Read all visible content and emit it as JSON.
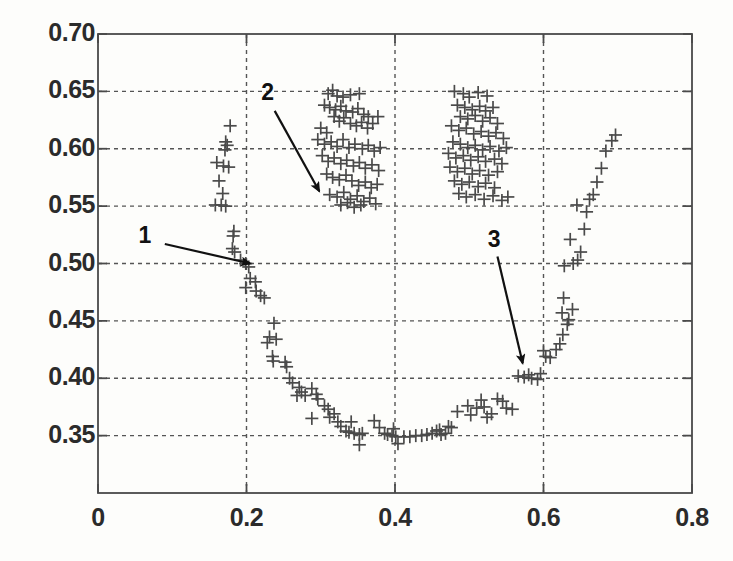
{
  "figure": {
    "type": "scatter-plot",
    "background_color": "#fdfdfb",
    "axis_color": "#4a4a4a",
    "grid_color": "#555555",
    "marker_color": "#4a4a4a",
    "annotation_color": "#111111"
  },
  "chart_data": {
    "type": "scatter",
    "title": "",
    "xlabel": "",
    "ylabel": "",
    "xlim": [
      0,
      0.8
    ],
    "ylim": [
      0.3,
      0.7
    ],
    "xticks": [
      0,
      0.2,
      0.4,
      0.6,
      0.8
    ],
    "xticklabels": [
      "0",
      "0.2",
      "0.4",
      "0.6",
      "0.8"
    ],
    "yticks": [
      0.35,
      0.4,
      0.45,
      0.5,
      0.55,
      0.6,
      0.65,
      0.7
    ],
    "yticklabels": [
      "0.35",
      "0.40",
      "0.45",
      "0.50",
      "0.55",
      "0.60",
      "0.65",
      "0.70"
    ],
    "yticklabels_shown": [
      "0.35",
      "0.40",
      "0.45",
      "0.50",
      "0.55",
      "0.60",
      "0.65",
      "0.70"
    ],
    "grid": true,
    "grid_style": "dashed",
    "legend": null,
    "marker": "+",
    "series": [
      {
        "name": "data",
        "points": [
          [
            0.178,
            0.62
          ],
          [
            0.172,
            0.606
          ],
          [
            0.174,
            0.603
          ],
          [
            0.171,
            0.599
          ],
          [
            0.16,
            0.588
          ],
          [
            0.169,
            0.585
          ],
          [
            0.176,
            0.584
          ],
          [
            0.163,
            0.572
          ],
          [
            0.168,
            0.561
          ],
          [
            0.158,
            0.551
          ],
          [
            0.166,
            0.551
          ],
          [
            0.172,
            0.55
          ],
          [
            0.183,
            0.528
          ],
          [
            0.182,
            0.524
          ],
          [
            0.181,
            0.513
          ],
          [
            0.184,
            0.51
          ],
          [
            0.192,
            0.503
          ],
          [
            0.199,
            0.5
          ],
          [
            0.203,
            0.497
          ],
          [
            0.205,
            0.487
          ],
          [
            0.212,
            0.484
          ],
          [
            0.199,
            0.479
          ],
          [
            0.213,
            0.476
          ],
          [
            0.219,
            0.472
          ],
          [
            0.224,
            0.47
          ],
          [
            0.237,
            0.448
          ],
          [
            0.231,
            0.436
          ],
          [
            0.24,
            0.434
          ],
          [
            0.228,
            0.431
          ],
          [
            0.235,
            0.419
          ],
          [
            0.236,
            0.415
          ],
          [
            0.252,
            0.414
          ],
          [
            0.254,
            0.41
          ],
          [
            0.258,
            0.4
          ],
          [
            0.262,
            0.396
          ],
          [
            0.271,
            0.392
          ],
          [
            0.274,
            0.388
          ],
          [
            0.268,
            0.385
          ],
          [
            0.279,
            0.385
          ],
          [
            0.288,
            0.391
          ],
          [
            0.294,
            0.386
          ],
          [
            0.296,
            0.382
          ],
          [
            0.305,
            0.376
          ],
          [
            0.31,
            0.373
          ],
          [
            0.288,
            0.365
          ],
          [
            0.312,
            0.366
          ],
          [
            0.318,
            0.369
          ],
          [
            0.323,
            0.362
          ],
          [
            0.327,
            0.358
          ],
          [
            0.334,
            0.354
          ],
          [
            0.338,
            0.353
          ],
          [
            0.345,
            0.352
          ],
          [
            0.341,
            0.362
          ],
          [
            0.352,
            0.351
          ],
          [
            0.356,
            0.352
          ],
          [
            0.352,
            0.342
          ],
          [
            0.372,
            0.363
          ],
          [
            0.379,
            0.357
          ],
          [
            0.386,
            0.352
          ],
          [
            0.39,
            0.351
          ],
          [
            0.396,
            0.35
          ],
          [
            0.398,
            0.356
          ],
          [
            0.401,
            0.349
          ],
          [
            0.404,
            0.343
          ],
          [
            0.412,
            0.349
          ],
          [
            0.42,
            0.349
          ],
          [
            0.428,
            0.35
          ],
          [
            0.436,
            0.35
          ],
          [
            0.443,
            0.351
          ],
          [
            0.45,
            0.352
          ],
          [
            0.456,
            0.354
          ],
          [
            0.46,
            0.355
          ],
          [
            0.462,
            0.351
          ],
          [
            0.468,
            0.352
          ],
          [
            0.472,
            0.358
          ],
          [
            0.476,
            0.357
          ],
          [
            0.484,
            0.371
          ],
          [
            0.498,
            0.376
          ],
          [
            0.502,
            0.368
          ],
          [
            0.51,
            0.374
          ],
          [
            0.516,
            0.381
          ],
          [
            0.52,
            0.375
          ],
          [
            0.524,
            0.366
          ],
          [
            0.53,
            0.369
          ],
          [
            0.538,
            0.382
          ],
          [
            0.545,
            0.38
          ],
          [
            0.55,
            0.374
          ],
          [
            0.558,
            0.373
          ],
          [
            0.566,
            0.402
          ],
          [
            0.574,
            0.401
          ],
          [
            0.58,
            0.403
          ],
          [
            0.584,
            0.4
          ],
          [
            0.592,
            0.399
          ],
          [
            0.596,
            0.404
          ],
          [
            0.603,
            0.419
          ],
          [
            0.609,
            0.418
          ],
          [
            0.6,
            0.424
          ],
          [
            0.617,
            0.425
          ],
          [
            0.622,
            0.43
          ],
          [
            0.626,
            0.438
          ],
          [
            0.632,
            0.447
          ],
          [
            0.634,
            0.451
          ],
          [
            0.625,
            0.457
          ],
          [
            0.639,
            0.46
          ],
          [
            0.627,
            0.47
          ],
          [
            0.64,
            0.5
          ],
          [
            0.628,
            0.498
          ],
          [
            0.646,
            0.503
          ],
          [
            0.65,
            0.51
          ],
          [
            0.636,
            0.521
          ],
          [
            0.655,
            0.53
          ],
          [
            0.658,
            0.545
          ],
          [
            0.645,
            0.551
          ],
          [
            0.662,
            0.556
          ],
          [
            0.667,
            0.56
          ],
          [
            0.672,
            0.571
          ],
          [
            0.678,
            0.583
          ],
          [
            0.684,
            0.598
          ],
          [
            0.692,
            0.607
          ],
          [
            0.697,
            0.612
          ],
          [
            0.31,
            0.648
          ],
          [
            0.316,
            0.651
          ],
          [
            0.322,
            0.646
          ],
          [
            0.33,
            0.645
          ],
          [
            0.34,
            0.647
          ],
          [
            0.352,
            0.648
          ],
          [
            0.305,
            0.638
          ],
          [
            0.312,
            0.636
          ],
          [
            0.32,
            0.634
          ],
          [
            0.327,
            0.637
          ],
          [
            0.334,
            0.633
          ],
          [
            0.343,
            0.632
          ],
          [
            0.35,
            0.635
          ],
          [
            0.358,
            0.63
          ],
          [
            0.364,
            0.628
          ],
          [
            0.318,
            0.628
          ],
          [
            0.325,
            0.624
          ],
          [
            0.331,
            0.627
          ],
          [
            0.34,
            0.622
          ],
          [
            0.348,
            0.62
          ],
          [
            0.355,
            0.623
          ],
          [
            0.363,
            0.618
          ],
          [
            0.37,
            0.622
          ],
          [
            0.377,
            0.628
          ],
          [
            0.3,
            0.618
          ],
          [
            0.308,
            0.614
          ],
          [
            0.296,
            0.608
          ],
          [
            0.305,
            0.604
          ],
          [
            0.314,
            0.606
          ],
          [
            0.322,
            0.602
          ],
          [
            0.33,
            0.608
          ],
          [
            0.338,
            0.601
          ],
          [
            0.346,
            0.604
          ],
          [
            0.356,
            0.6
          ],
          [
            0.364,
            0.603
          ],
          [
            0.372,
            0.598
          ],
          [
            0.38,
            0.601
          ],
          [
            0.302,
            0.594
          ],
          [
            0.31,
            0.589
          ],
          [
            0.318,
            0.592
          ],
          [
            0.327,
            0.587
          ],
          [
            0.335,
            0.59
          ],
          [
            0.344,
            0.585
          ],
          [
            0.352,
            0.588
          ],
          [
            0.36,
            0.583
          ],
          [
            0.369,
            0.586
          ],
          [
            0.378,
            0.581
          ],
          [
            0.308,
            0.578
          ],
          [
            0.316,
            0.575
          ],
          [
            0.325,
            0.573
          ],
          [
            0.334,
            0.577
          ],
          [
            0.342,
            0.572
          ],
          [
            0.351,
            0.568
          ],
          [
            0.36,
            0.571
          ],
          [
            0.368,
            0.566
          ],
          [
            0.376,
            0.569
          ],
          [
            0.312,
            0.56
          ],
          [
            0.322,
            0.558
          ],
          [
            0.331,
            0.562
          ],
          [
            0.34,
            0.556
          ],
          [
            0.349,
            0.559
          ],
          [
            0.358,
            0.554
          ],
          [
            0.366,
            0.557
          ],
          [
            0.374,
            0.552
          ],
          [
            0.327,
            0.551
          ],
          [
            0.336,
            0.553
          ],
          [
            0.345,
            0.549
          ],
          [
            0.354,
            0.551
          ],
          [
            0.48,
            0.65
          ],
          [
            0.492,
            0.648
          ],
          [
            0.5,
            0.645
          ],
          [
            0.512,
            0.649
          ],
          [
            0.524,
            0.646
          ],
          [
            0.484,
            0.638
          ],
          [
            0.494,
            0.636
          ],
          [
            0.504,
            0.634
          ],
          [
            0.514,
            0.637
          ],
          [
            0.522,
            0.633
          ],
          [
            0.532,
            0.636
          ],
          [
            0.488,
            0.628
          ],
          [
            0.498,
            0.626
          ],
          [
            0.508,
            0.629
          ],
          [
            0.518,
            0.624
          ],
          [
            0.528,
            0.627
          ],
          [
            0.538,
            0.622
          ],
          [
            0.476,
            0.62
          ],
          [
            0.486,
            0.616
          ],
          [
            0.496,
            0.618
          ],
          [
            0.506,
            0.613
          ],
          [
            0.516,
            0.615
          ],
          [
            0.526,
            0.611
          ],
          [
            0.536,
            0.614
          ],
          [
            0.546,
            0.609
          ],
          [
            0.478,
            0.606
          ],
          [
            0.488,
            0.604
          ],
          [
            0.498,
            0.601
          ],
          [
            0.508,
            0.603
          ],
          [
            0.518,
            0.599
          ],
          [
            0.528,
            0.602
          ],
          [
            0.54,
            0.598
          ],
          [
            0.55,
            0.601
          ],
          [
            0.472,
            0.596
          ],
          [
            0.482,
            0.592
          ],
          [
            0.492,
            0.594
          ],
          [
            0.502,
            0.59
          ],
          [
            0.512,
            0.593
          ],
          [
            0.522,
            0.589
          ],
          [
            0.534,
            0.591
          ],
          [
            0.544,
            0.587
          ],
          [
            0.474,
            0.584
          ],
          [
            0.484,
            0.58
          ],
          [
            0.494,
            0.583
          ],
          [
            0.504,
            0.578
          ],
          [
            0.514,
            0.581
          ],
          [
            0.526,
            0.577
          ],
          [
            0.538,
            0.58
          ],
          [
            0.48,
            0.572
          ],
          [
            0.49,
            0.569
          ],
          [
            0.5,
            0.571
          ],
          [
            0.512,
            0.567
          ],
          [
            0.522,
            0.57
          ],
          [
            0.534,
            0.566
          ],
          [
            0.486,
            0.561
          ],
          [
            0.496,
            0.558
          ],
          [
            0.508,
            0.56
          ],
          [
            0.52,
            0.556
          ],
          [
            0.532,
            0.559
          ],
          [
            0.544,
            0.555
          ],
          [
            0.552,
            0.558
          ]
        ]
      }
    ],
    "annotations": [
      {
        "label": "1",
        "label_x": 0.0625,
        "label_y": 0.523,
        "arrow_from_x": 0.09,
        "arrow_from_y": 0.517,
        "arrow_to_x": 0.205,
        "arrow_to_y": 0.5
      },
      {
        "label": "2",
        "label_x": 0.228,
        "label_y": 0.648,
        "arrow_from_x": 0.238,
        "arrow_from_y": 0.633,
        "arrow_to_x": 0.298,
        "arrow_to_y": 0.563
      },
      {
        "label": "3",
        "label_x": 0.533,
        "label_y": 0.52,
        "arrow_from_x": 0.538,
        "arrow_from_y": 0.506,
        "arrow_to_x": 0.572,
        "arrow_to_y": 0.413
      }
    ]
  }
}
